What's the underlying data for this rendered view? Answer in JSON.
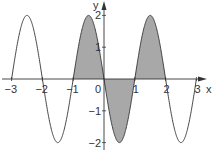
{
  "chart_data": {
    "type": "line",
    "function": "y = -2 sin(pi x)",
    "title": "",
    "xlabel": "x",
    "ylabel": "y",
    "xlim": [
      -3,
      3
    ],
    "ylim": [
      -2,
      2
    ],
    "x_ticks": [
      -3,
      -2,
      -1,
      0,
      1,
      2,
      3
    ],
    "x_tick_labels": [
      "−3",
      "−2",
      "−1",
      "0",
      "1",
      "2",
      "3"
    ],
    "y_ticks": [
      -2,
      -1,
      1,
      2
    ],
    "y_tick_labels": [
      "−2",
      "−1",
      "1",
      "2"
    ],
    "shaded_region": {
      "from_x": -1,
      "to_x": 2,
      "between": "curve and x-axis",
      "color": "#a8a8a8"
    },
    "points": [
      {
        "x": -3,
        "y": 0
      },
      {
        "x": -2.5,
        "y": 2
      },
      {
        "x": -2,
        "y": 0
      },
      {
        "x": -1.5,
        "y": -2
      },
      {
        "x": -1,
        "y": 0
      },
      {
        "x": -0.5,
        "y": 2
      },
      {
        "x": 0,
        "y": 0
      },
      {
        "x": 0.5,
        "y": -2
      },
      {
        "x": 1,
        "y": 0
      },
      {
        "x": 1.5,
        "y": 2
      },
      {
        "x": 2,
        "y": 0
      },
      {
        "x": 2.5,
        "y": -2
      },
      {
        "x": 3,
        "y": 0
      }
    ],
    "grid": false,
    "legend": null
  },
  "colors": {
    "curve": "#333333",
    "axis": "#333333",
    "fill": "#a8a8a8"
  }
}
